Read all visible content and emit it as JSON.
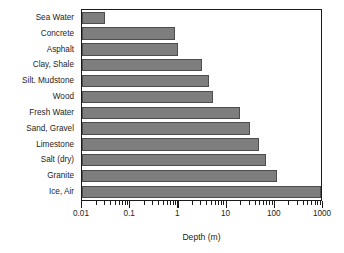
{
  "chart_data": {
    "type": "bar",
    "orientation": "horizontal",
    "title": "",
    "xlabel": "Depth (m)",
    "ylabel": "",
    "xscale": "log",
    "xlim": [
      0.01,
      1000
    ],
    "grid": false,
    "legend": null,
    "categories": [
      "Sea Water",
      "Concrete",
      "Asphalt",
      "Clay, Shale",
      "Silt. Mudstone",
      "Wood",
      "Fresh Water",
      "Sand, Gravel",
      "Limestone",
      "Salt (dry)",
      "Granite",
      "Ice, Air"
    ],
    "values": [
      0.03,
      0.87,
      1.0,
      3.2,
      4.5,
      5.5,
      20,
      32,
      50,
      70,
      120,
      1000
    ],
    "xticks": [
      0.01,
      0.1,
      1,
      10,
      100,
      1000
    ],
    "xticklabels": [
      "0.01",
      "0.1",
      "1",
      "10",
      "100",
      "1000"
    ],
    "bar_color": "#7e7e7e",
    "bar_edge_color": "#4d4d4d",
    "frame_color": "#1a1a1a"
  }
}
